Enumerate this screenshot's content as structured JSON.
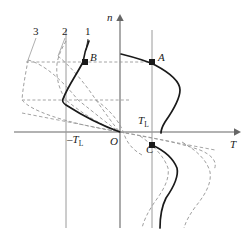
{
  "figure": {
    "type": "diagram",
    "axes": {
      "vertical_label": "n",
      "horizontal_label": "T",
      "origin_label": "O"
    },
    "curve_labels": [
      {
        "id": "c3",
        "text": "3",
        "x": 33,
        "y": 32
      },
      {
        "id": "c2",
        "text": "2",
        "x": 62,
        "y": 32
      },
      {
        "id": "c1",
        "text": "1",
        "x": 85,
        "y": 32
      }
    ],
    "point_labels": [
      {
        "id": "point-b",
        "text": "B",
        "x": 90,
        "y": 56
      },
      {
        "id": "point-a",
        "text": "A",
        "x": 158,
        "y": 56
      },
      {
        "id": "point-c",
        "text": "C",
        "x": 147,
        "y": 148
      }
    ],
    "value_labels": [
      {
        "id": "load-torque-positive",
        "main": "T",
        "sub": "L",
        "x": 138,
        "y": 119
      },
      {
        "id": "load-torque-negative",
        "main": "–T",
        "sub": "L",
        "x": 68,
        "y": 137
      }
    ],
    "points": [
      {
        "id": "A",
        "x": 152,
        "y": 62
      },
      {
        "id": "B",
        "x": 85,
        "y": 62
      },
      {
        "id": "C",
        "x": 152,
        "y": 145
      }
    ],
    "colors": {
      "axis": "#666666",
      "solid_curve": "#1a1a1a",
      "dashed_curve": "#999999",
      "gridline": "#9a9a9a",
      "text": "#1a1a1a",
      "background": "#ffffff"
    }
  }
}
